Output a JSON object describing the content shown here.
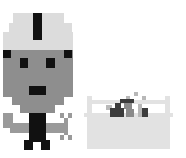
{
  "scene": {
    "background": "#ffffff",
    "colors": {
      "helmet": "#dcdcdc",
      "face": "#8e8e8e",
      "black": "#111111",
      "arm": "#9a9a9a",
      "box": "#e2e2e2",
      "box_items_dark": "#3c3c3c",
      "box_items_mid": "#8a8a8a",
      "box_items_light": "#b8b8b8"
    },
    "character": {
      "name": "robot-worker",
      "rects": [
        [
          13,
          13,
          20,
          10,
          "helmet"
        ],
        [
          42,
          13,
          22,
          10,
          "helmet"
        ],
        [
          33,
          13,
          9,
          27,
          "black"
        ],
        [
          9,
          23,
          24,
          9,
          "helmet"
        ],
        [
          42,
          23,
          30,
          9,
          "helmet"
        ],
        [
          3,
          32,
          30,
          18,
          "helmet"
        ],
        [
          42,
          32,
          31,
          18,
          "helmet"
        ],
        [
          33,
          40,
          9,
          10,
          "helmet"
        ],
        [
          3,
          50,
          70,
          47,
          "face"
        ],
        [
          3,
          50,
          8,
          8,
          "black"
        ],
        [
          64,
          50,
          8,
          8,
          "black"
        ],
        [
          20,
          58,
          8,
          10,
          "black"
        ],
        [
          46,
          58,
          9,
          10,
          "black"
        ],
        [
          29,
          86,
          17,
          9,
          "black"
        ],
        [
          12,
          97,
          52,
          8,
          "face"
        ],
        [
          20,
          105,
          35,
          8,
          "face"
        ],
        [
          29,
          113,
          17,
          29,
          "black"
        ],
        [
          24,
          140,
          9,
          10,
          "black"
        ],
        [
          41,
          140,
          9,
          10,
          "black"
        ],
        [
          3,
          113,
          10,
          15,
          "arm"
        ],
        [
          10,
          123,
          19,
          10,
          "arm"
        ],
        [
          46,
          123,
          18,
          10,
          "arm"
        ],
        [
          60,
          113,
          4,
          5,
          "arm"
        ],
        [
          68,
          113,
          4,
          5,
          "arm"
        ],
        [
          64,
          118,
          4,
          17,
          "arm"
        ],
        [
          60,
          135,
          4,
          5,
          "arm"
        ],
        [
          68,
          135,
          4,
          5,
          "arm"
        ]
      ]
    },
    "toolbox": {
      "name": "toolbox",
      "rects": [
        [
          87,
          96,
          5,
          21,
          "box"
        ],
        [
          165,
          96,
          5,
          21,
          "box"
        ],
        [
          87,
          100,
          83,
          4,
          "box"
        ],
        [
          87,
          117,
          83,
          32,
          "box"
        ],
        [
          84,
          113,
          89,
          4,
          "box"
        ],
        [
          126,
          96,
          4,
          4,
          "box_items_light"
        ],
        [
          134,
          92,
          4,
          4,
          "box_items_light"
        ],
        [
          142,
          96,
          4,
          4,
          "box_items_light"
        ],
        [
          120,
          99,
          14,
          4,
          "box_items_dark"
        ],
        [
          106,
          105,
          6,
          5,
          "box_items_light"
        ],
        [
          112,
          110,
          6,
          7,
          "box_items_light"
        ],
        [
          115,
          103,
          6,
          6,
          "box_items_dark"
        ],
        [
          110,
          108,
          14,
          9,
          "box_items_dark"
        ],
        [
          124,
          103,
          8,
          6,
          "box_items_mid"
        ],
        [
          126,
          109,
          8,
          8,
          "box_items_mid"
        ],
        [
          138,
          104,
          4,
          13,
          "box_items_light"
        ],
        [
          142,
          108,
          6,
          9,
          "box_items_dark"
        ]
      ]
    }
  }
}
